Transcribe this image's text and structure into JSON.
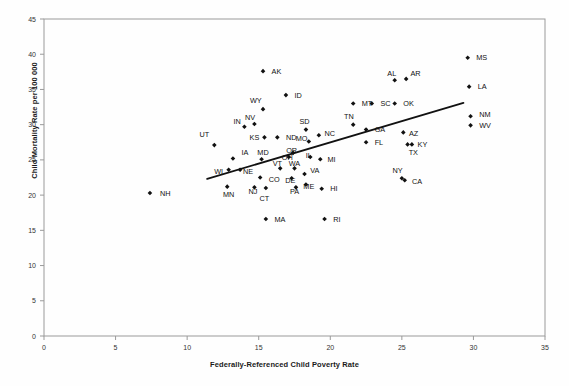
{
  "chart_data": {
    "type": "scatter",
    "title": "",
    "xlabel": "Federally-Referenced Child Poverty Rate",
    "ylabel": "Child Mortality Rate per 100 000",
    "xlim": [
      0,
      35
    ],
    "ylim": [
      0,
      45
    ],
    "xticks": [
      0,
      5,
      10,
      15,
      20,
      25,
      30,
      35
    ],
    "yticks": [
      0,
      5,
      10,
      15,
      20,
      25,
      30,
      35,
      40,
      45
    ],
    "grid": false,
    "legend": "none",
    "point_color": "#111111",
    "line_color": "#111111",
    "trendline": {
      "x0": 11.4,
      "y0": 22.3,
      "x1": 29.3,
      "y1": 33.1
    },
    "points": [
      {
        "label": "NH",
        "x": 7.4,
        "y": 20.3,
        "lx": 8.1,
        "ly": 20.3,
        "anchor": "start"
      },
      {
        "label": "UT",
        "x": 11.9,
        "y": 27.1,
        "lx": 11.2,
        "ly": 28.6,
        "anchor": "middle"
      },
      {
        "label": "WI",
        "x": 12.9,
        "y": 23.6,
        "lx": 12.2,
        "ly": 23.3,
        "anchor": "middle"
      },
      {
        "label": "IA",
        "x": 13.2,
        "y": 25.2,
        "lx": 13.8,
        "ly": 26.1,
        "anchor": "start"
      },
      {
        "label": "MN",
        "x": 12.8,
        "y": 21.2,
        "lx": 12.9,
        "ly": 20.1,
        "anchor": "middle"
      },
      {
        "label": "NE",
        "x": 13.7,
        "y": 23.6,
        "lx": 13.9,
        "ly": 23.3,
        "anchor": "start"
      },
      {
        "label": "IN",
        "x": 14.0,
        "y": 29.7,
        "lx": 13.5,
        "ly": 30.5,
        "anchor": "middle"
      },
      {
        "label": "NV",
        "x": 14.7,
        "y": 30.1,
        "lx": 14.4,
        "ly": 31.0,
        "anchor": "middle"
      },
      {
        "label": "WY",
        "x": 15.3,
        "y": 32.2,
        "lx": 14.8,
        "ly": 33.5,
        "anchor": "middle"
      },
      {
        "label": "KS",
        "x": 15.4,
        "y": 28.2,
        "lx": 14.7,
        "ly": 28.2,
        "anchor": "middle"
      },
      {
        "label": "ND",
        "x": 16.3,
        "y": 28.2,
        "lx": 16.9,
        "ly": 28.2,
        "anchor": "start"
      },
      {
        "label": "MD",
        "x": 15.2,
        "y": 25.1,
        "lx": 15.3,
        "ly": 26.1,
        "anchor": "middle"
      },
      {
        "label": "CO",
        "x": 15.1,
        "y": 22.5,
        "lx": 15.7,
        "ly": 22.2,
        "anchor": "start"
      },
      {
        "label": "NJ",
        "x": 14.7,
        "y": 21.1,
        "lx": 14.6,
        "ly": 20.5,
        "anchor": "middle"
      },
      {
        "label": "CT",
        "x": 15.5,
        "y": 21.0,
        "lx": 15.4,
        "ly": 19.6,
        "anchor": "middle"
      },
      {
        "label": "MA",
        "x": 15.5,
        "y": 16.6,
        "lx": 16.1,
        "ly": 16.6,
        "anchor": "start"
      },
      {
        "label": "VT",
        "x": 16.5,
        "y": 23.8,
        "lx": 16.3,
        "ly": 24.5,
        "anchor": "middle"
      },
      {
        "label": "WA",
        "x": 17.5,
        "y": 23.8,
        "lx": 17.5,
        "ly": 24.5,
        "anchor": "middle"
      },
      {
        "label": "DE",
        "x": 17.3,
        "y": 22.4,
        "lx": 17.2,
        "ly": 22.1,
        "anchor": "middle"
      },
      {
        "label": "PA",
        "x": 17.6,
        "y": 21.1,
        "lx": 17.5,
        "ly": 20.5,
        "anchor": "middle"
      },
      {
        "label": "ME",
        "x": 18.3,
        "y": 21.5,
        "lx": 18.5,
        "ly": 21.3,
        "anchor": "middle"
      },
      {
        "label": "VA",
        "x": 18.2,
        "y": 23.0,
        "lx": 18.6,
        "ly": 23.5,
        "anchor": "start"
      },
      {
        "label": "OH",
        "x": 17.1,
        "y": 25.4,
        "lx": 17.0,
        "ly": 25.3,
        "anchor": "middle"
      },
      {
        "label": "OR",
        "x": 17.4,
        "y": 26.0,
        "lx": 17.3,
        "ly": 26.4,
        "anchor": "middle"
      },
      {
        "label": "IL",
        "x": 18.6,
        "y": 25.4,
        "lx": 18.5,
        "ly": 25.7,
        "anchor": "middle"
      },
      {
        "label": "MI",
        "x": 19.3,
        "y": 25.1,
        "lx": 19.8,
        "ly": 25.1,
        "anchor": "start"
      },
      {
        "label": "HI",
        "x": 19.4,
        "y": 20.9,
        "lx": 20.0,
        "ly": 20.9,
        "anchor": "start"
      },
      {
        "label": "RI",
        "x": 19.6,
        "y": 16.6,
        "lx": 20.2,
        "ly": 16.6,
        "anchor": "start"
      },
      {
        "label": "ID",
        "x": 16.9,
        "y": 34.2,
        "lx": 17.5,
        "ly": 34.2,
        "anchor": "start"
      },
      {
        "label": "SD",
        "x": 18.3,
        "y": 29.3,
        "lx": 18.2,
        "ly": 30.4,
        "anchor": "middle"
      },
      {
        "label": "MO",
        "x": 18.5,
        "y": 27.6,
        "lx": 18.0,
        "ly": 28.1,
        "anchor": "middle"
      },
      {
        "label": "NC",
        "x": 19.2,
        "y": 28.5,
        "lx": 19.6,
        "ly": 28.8,
        "anchor": "start"
      },
      {
        "label": "AK",
        "x": 15.3,
        "y": 37.6,
        "lx": 15.9,
        "ly": 37.6,
        "anchor": "start"
      },
      {
        "label": "TN",
        "x": 21.6,
        "y": 30.0,
        "lx": 21.3,
        "ly": 31.2,
        "anchor": "middle"
      },
      {
        "label": "GA",
        "x": 22.5,
        "y": 29.3,
        "lx": 23.1,
        "ly": 29.3,
        "anchor": "start"
      },
      {
        "label": "FL",
        "x": 22.5,
        "y": 27.5,
        "lx": 23.1,
        "ly": 27.5,
        "anchor": "start"
      },
      {
        "label": "MT",
        "x": 21.6,
        "y": 33.0,
        "lx": 22.2,
        "ly": 33.0,
        "anchor": "start"
      },
      {
        "label": "SC",
        "x": 22.9,
        "y": 33.0,
        "lx": 23.5,
        "ly": 33.0,
        "anchor": "start"
      },
      {
        "label": "OK",
        "x": 24.5,
        "y": 33.0,
        "lx": 25.1,
        "ly": 33.0,
        "anchor": "start"
      },
      {
        "label": "AL",
        "x": 24.5,
        "y": 36.3,
        "lx": 24.3,
        "ly": 37.3,
        "anchor": "middle"
      },
      {
        "label": "AR",
        "x": 25.3,
        "y": 36.5,
        "lx": 25.6,
        "ly": 37.3,
        "anchor": "start"
      },
      {
        "label": "AZ",
        "x": 25.1,
        "y": 28.9,
        "lx": 25.5,
        "ly": 28.7,
        "anchor": "start"
      },
      {
        "label": "KY",
        "x": 25.7,
        "y": 27.2,
        "lx": 26.1,
        "ly": 27.2,
        "anchor": "start"
      },
      {
        "label": "TX",
        "x": 25.4,
        "y": 27.2,
        "lx": 25.8,
        "ly": 26.1,
        "anchor": "middle"
      },
      {
        "label": "NY",
        "x": 25.0,
        "y": 22.4,
        "lx": 24.7,
        "ly": 23.5,
        "anchor": "middle"
      },
      {
        "label": "CA",
        "x": 25.2,
        "y": 22.1,
        "lx": 25.7,
        "ly": 21.9,
        "anchor": "start"
      },
      {
        "label": "MS",
        "x": 29.6,
        "y": 39.5,
        "lx": 30.2,
        "ly": 39.5,
        "anchor": "start"
      },
      {
        "label": "LA",
        "x": 29.7,
        "y": 35.4,
        "lx": 30.3,
        "ly": 35.4,
        "anchor": "start"
      },
      {
        "label": "NM",
        "x": 29.8,
        "y": 31.2,
        "lx": 30.4,
        "ly": 31.4,
        "anchor": "start"
      },
      {
        "label": "WV",
        "x": 29.8,
        "y": 29.9,
        "lx": 30.4,
        "ly": 29.9,
        "anchor": "start"
      }
    ]
  }
}
